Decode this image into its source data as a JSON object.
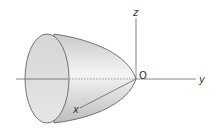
{
  "diagram": {
    "type": "3d-solid",
    "labels": {
      "z_axis": "z",
      "y_axis": "y",
      "x_axis": "x",
      "origin": "O"
    },
    "colors": {
      "surface": "#d9d9d9",
      "cap": "#e3e3e3",
      "stroke": "#555555"
    }
  }
}
